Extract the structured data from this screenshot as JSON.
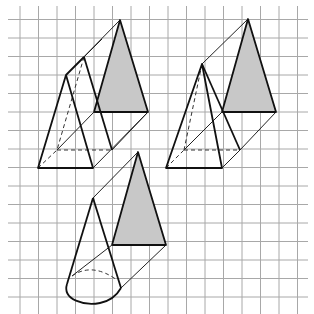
{
  "figure": {
    "header_text": "",
    "grid": {
      "line_color": "#a8a8a8",
      "x_lines": [
        20,
        38.5,
        57,
        75.5,
        94,
        112.5,
        131,
        149.5,
        168,
        186.5,
        205,
        223.5,
        242,
        260.5,
        279,
        297.5
      ],
      "y_lines": [
        19.5,
        38,
        56.5,
        75,
        93.5,
        112,
        130.5,
        149,
        167.5,
        186,
        204.5,
        223,
        241.5,
        260,
        278.5,
        297
      ],
      "x_extent": [
        8,
        308
      ],
      "y_extent": [
        6,
        314
      ]
    },
    "colors": {
      "stroke": "#111111",
      "thin_stroke": "#222222",
      "shade": "#c8c8c8",
      "background": "#ffffff"
    },
    "solids": [
      {
        "name": "triangular-prism-left",
        "shaded_triangle": [
          [
            120,
            20
          ],
          [
            94,
            112
          ],
          [
            148,
            112
          ]
        ],
        "front_triangle": [
          [
            66,
            75
          ],
          [
            38,
            168
          ],
          [
            93,
            168
          ]
        ],
        "middle_triangle_visible": [
          [
            84,
            57
          ],
          [
            112,
            150
          ]
        ],
        "hidden_edges": [
          [
            [
              84,
              57
            ],
            [
              57,
              150
            ]
          ],
          [
            [
              57,
              150
            ],
            [
              112,
              150
            ]
          ],
          [
            [
              38,
              168
            ],
            [
              57,
              150
            ]
          ]
        ],
        "thin_edges": [
          [
            [
              66,
              75
            ],
            [
              120,
              20
            ]
          ],
          [
            [
              57,
              150
            ],
            [
              94,
              112
            ]
          ],
          [
            [
              93,
              168
            ],
            [
              148,
              112
            ]
          ],
          [
            [
              112,
              150
            ],
            [
              148,
              112
            ]
          ]
        ]
      },
      {
        "name": "pyramid-prism-right",
        "shaded_triangle": [
          [
            248,
            19
          ],
          [
            222,
            112
          ],
          [
            276,
            112
          ]
        ],
        "front_triangle": [
          [
            202,
            64
          ],
          [
            166,
            168
          ],
          [
            222,
            168
          ]
        ],
        "hidden_edges": [
          [
            [
              202,
              64
            ],
            [
              184,
              150
            ]
          ],
          [
            [
              184,
              150
            ],
            [
              240,
              150
            ]
          ],
          [
            [
              166,
              168
            ],
            [
              184,
              150
            ]
          ]
        ],
        "thin_edges": [
          [
            [
              202,
              64
            ],
            [
              248,
              19
            ]
          ],
          [
            [
              184,
              150
            ],
            [
              222,
              112
            ]
          ],
          [
            [
              240,
              150
            ],
            [
              276,
              112
            ]
          ],
          [
            [
              222,
              168
            ],
            [
              240,
              150
            ]
          ]
        ]
      },
      {
        "name": "cone-bottom",
        "shaded_triangle": [
          [
            138,
            152
          ],
          [
            112,
            245
          ],
          [
            166,
            245
          ]
        ],
        "cone_apex": [
          93,
          198
        ],
        "cone_left": [
          67,
          284
        ],
        "cone_right": [
          121,
          288
        ],
        "thin_edges": [
          [
            [
              93,
              198
            ],
            [
              138,
              152
            ]
          ],
          [
            [
              72,
              276
            ],
            [
              112,
              245
            ]
          ],
          [
            [
              121,
              288
            ],
            [
              166,
              245
            ]
          ]
        ]
      }
    ]
  }
}
